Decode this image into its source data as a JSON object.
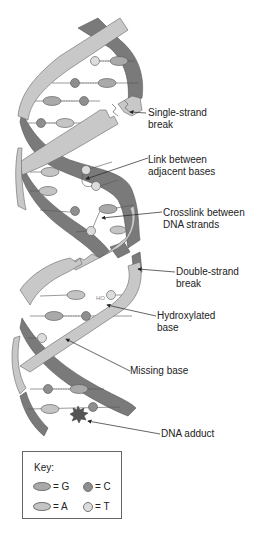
{
  "figure": {
    "labels": {
      "single_strand_break": [
        "Single-strand",
        "break"
      ],
      "link_adjacent": [
        "Link between",
        "adjacent bases"
      ],
      "crosslink": [
        "Crosslink between",
        "DNA strands"
      ],
      "double_strand_break": [
        "Double-strand",
        "break"
      ],
      "hydroxylated": [
        "Hydroxylated",
        "base"
      ],
      "missing_base": [
        "Missing base"
      ],
      "adduct": [
        "DNA adduct"
      ],
      "ho_mark": "HO"
    },
    "key": {
      "title": "Key:",
      "items": [
        {
          "symbol": "oval-dark",
          "label": "= G"
        },
        {
          "symbol": "circle-dark",
          "label": "= C"
        },
        {
          "symbol": "oval-light",
          "label": "= A"
        },
        {
          "symbol": "circle-light",
          "label": "= T"
        }
      ]
    },
    "colors": {
      "strand_front": "#c8c8c8",
      "strand_back": "#7a7a7a",
      "base_G": "#a9a9a9",
      "base_C": "#8e8e8e",
      "base_A": "#c4c4c4",
      "base_T": "#dcdcdc",
      "outline": "#666666"
    }
  }
}
